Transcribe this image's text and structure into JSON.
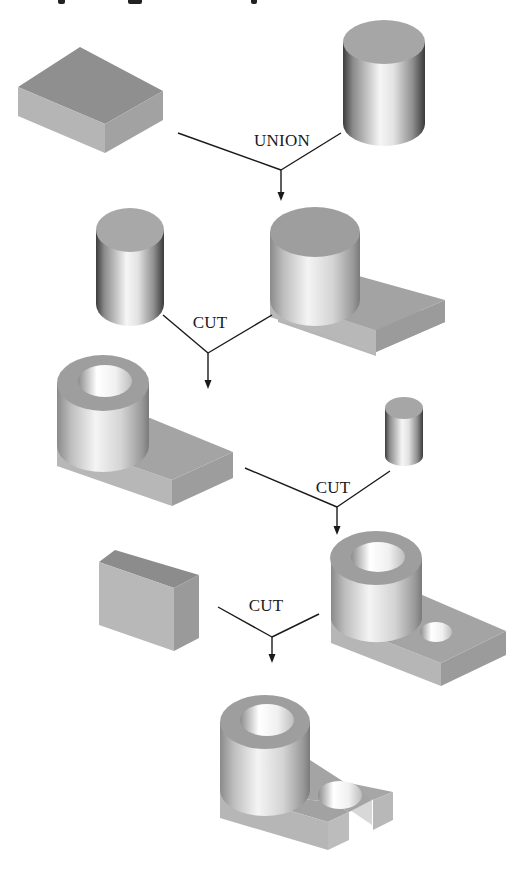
{
  "diagram": {
    "type": "csg-construction-tree",
    "colors": {
      "background": "#ffffff",
      "line": "#1a1a1a",
      "top_face": "#9c9c9c",
      "front_face": "#b8b8b8",
      "side_face": "#a8a8a8",
      "highlight": "#f4f4f4",
      "shadow": "#3a3a3a"
    },
    "steps": [
      {
        "operation": "UNION",
        "inputs": [
          "rectangular-block",
          "cylinder"
        ],
        "result": "cylinder-on-plate"
      },
      {
        "operation": "CUT",
        "inputs": [
          "cylinder",
          "cylinder-on-plate"
        ],
        "result": "bored-cylinder-on-plate"
      },
      {
        "operation": "CUT",
        "inputs": [
          "bored-cylinder-on-plate",
          "small-cylinder"
        ],
        "result": "plate-with-hole"
      },
      {
        "operation": "CUT",
        "inputs": [
          "thin-block",
          "plate-with-hole"
        ],
        "result": "slotted-bracket"
      }
    ],
    "labels": {
      "op1": "UNION",
      "op2": "CUT",
      "op3": "CUT",
      "op4": "CUT"
    }
  }
}
